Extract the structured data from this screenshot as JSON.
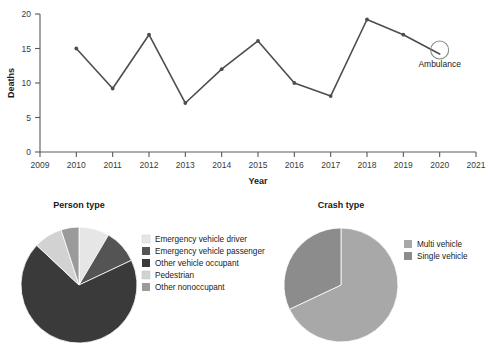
{
  "chart_data": [
    {
      "type": "line",
      "title": "",
      "xlabel": "Year",
      "ylabel": "Deaths",
      "xlim": [
        2009,
        2021
      ],
      "ylim": [
        0,
        20
      ],
      "ytick_labels": [
        "0",
        "5",
        "10",
        "15",
        "20"
      ],
      "yticks": [
        0,
        5,
        10,
        15,
        20
      ],
      "xtick_labels": [
        "2009",
        "2010",
        "2011",
        "2012",
        "2013",
        "2014",
        "2015",
        "2016",
        "2017",
        "2018",
        "2019",
        "2020",
        "2021"
      ],
      "xticks": [
        2009,
        2010,
        2011,
        2012,
        2013,
        2014,
        2015,
        2016,
        2017,
        2018,
        2019,
        2020,
        2021
      ],
      "grid": false,
      "legend_position": "none",
      "series": [
        {
          "name": "Ambulance",
          "x": [
            2010,
            2011,
            2012,
            2013,
            2014,
            2015,
            2016,
            2017,
            2018,
            2019,
            2020
          ],
          "values": [
            15,
            9.2,
            17,
            7.1,
            12,
            16.1,
            10,
            8.1,
            19.2,
            17,
            14.2
          ],
          "color": "#4d4d4d",
          "marker": "circle"
        }
      ],
      "annotations": [
        {
          "label": "Ambulance",
          "x": 2020,
          "y": 14.2,
          "marker": "open-circle"
        }
      ]
    },
    {
      "type": "pie",
      "title": "Person type",
      "legend_position": "right",
      "categories": [
        "Emergency vehicle driver",
        "Emergency vehicle passenger",
        "Other vehicle occupant",
        "Pedestrian",
        "Other nonoccupant"
      ],
      "values": [
        8.5,
        9.5,
        69.0,
        8.0,
        5.0
      ],
      "colors": [
        "#e6e6e6",
        "#545454",
        "#3a3a3a",
        "#d2d2d2",
        "#9a9a9a"
      ],
      "start_angle": 0
    },
    {
      "type": "pie",
      "title": "Crash type",
      "legend_position": "right",
      "categories": [
        "Multi vehicle",
        "Single vehicle"
      ],
      "values": [
        68.0,
        32.0
      ],
      "colors": [
        "#a8a8a8",
        "#8c8c8c"
      ],
      "start_angle": 0
    }
  ],
  "line_chart": {
    "ylabel": "Deaths",
    "xlabel": "Year",
    "yticks": [
      "0",
      "5",
      "10",
      "15",
      "20"
    ],
    "xticks": [
      "2009",
      "2010",
      "2011",
      "2012",
      "2013",
      "2014",
      "2015",
      "2016",
      "2017",
      "2018",
      "2019",
      "2020",
      "2021"
    ],
    "annotation_label": "Ambulance"
  },
  "person_pie": {
    "title": "Person type",
    "legend": [
      {
        "label": "Emergency vehicle driver",
        "color": "#e6e6e6"
      },
      {
        "label": "Emergency vehicle passenger",
        "color": "#545454"
      },
      {
        "label": "Other vehicle occupant",
        "color": "#3a3a3a"
      },
      {
        "label": "Pedestrian",
        "color": "#d2d2d2"
      },
      {
        "label": "Other nonoccupant",
        "color": "#9a9a9a"
      }
    ]
  },
  "crash_pie": {
    "title": "Crash type",
    "legend": [
      {
        "label": "Multi vehicle",
        "color": "#a8a8a8"
      },
      {
        "label": "Single vehicle",
        "color": "#8c8c8c"
      }
    ]
  }
}
